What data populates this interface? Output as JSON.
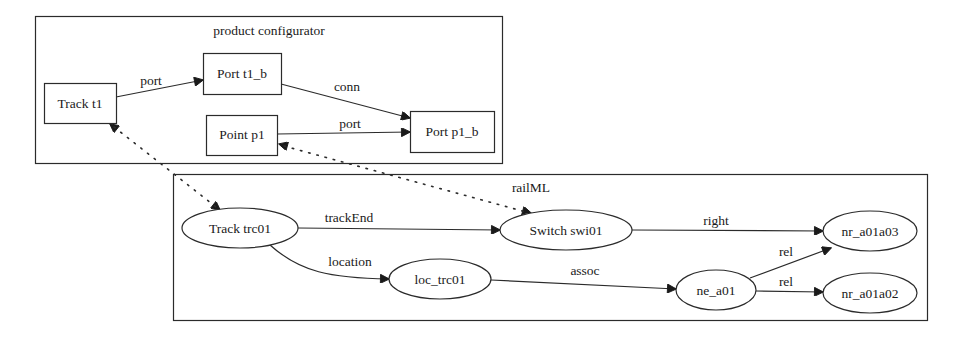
{
  "diagram": {
    "clusters": {
      "product_configurator": {
        "label": "product configurator"
      },
      "railml": {
        "label": "railML"
      }
    },
    "nodes": {
      "track_t1": {
        "label": "Track t1",
        "shape": "box"
      },
      "port_t1_b": {
        "label": "Port t1_b",
        "shape": "box"
      },
      "point_p1": {
        "label": "Point p1",
        "shape": "box"
      },
      "port_p1_b": {
        "label": "Port p1_b",
        "shape": "box"
      },
      "track_trc01": {
        "label": "Track trc01",
        "shape": "ellipse"
      },
      "switch_swi01": {
        "label": "Switch swi01",
        "shape": "ellipse"
      },
      "loc_trc01": {
        "label": "loc_trc01",
        "shape": "ellipse"
      },
      "ne_a01": {
        "label": "ne_a01",
        "shape": "ellipse"
      },
      "nr_a01a03": {
        "label": "nr_a01a03",
        "shape": "ellipse"
      },
      "nr_a01a02": {
        "label": "nr_a01a02",
        "shape": "ellipse"
      }
    },
    "edges": {
      "track_t1_port_t1_b": {
        "label": "port",
        "from": "Track t1",
        "to": "Port t1_b",
        "style": "solid"
      },
      "port_t1_b_port_p1_b": {
        "label": "conn",
        "from": "Port t1_b",
        "to": "Port p1_b",
        "style": "solid"
      },
      "point_p1_port_p1_b": {
        "label": "port",
        "from": "Point p1",
        "to": "Port p1_b",
        "style": "solid"
      },
      "track_trc01_switch_swi01": {
        "label": "trackEnd",
        "from": "Track trc01",
        "to": "Switch swi01",
        "style": "solid"
      },
      "track_trc01_loc_trc01": {
        "label": "location",
        "from": "Track trc01",
        "to": "loc_trc01",
        "style": "solid"
      },
      "switch_swi01_nr_a01a03": {
        "label": "right",
        "from": "Switch swi01",
        "to": "nr_a01a03",
        "style": "solid"
      },
      "loc_trc01_ne_a01": {
        "label": "assoc",
        "from": "loc_trc01",
        "to": "ne_a01",
        "style": "solid"
      },
      "ne_a01_nr_a01a03": {
        "label": "rel",
        "from": "ne_a01",
        "to": "nr_a01a03",
        "style": "solid"
      },
      "ne_a01_nr_a01a02": {
        "label": "rel",
        "from": "ne_a01",
        "to": "nr_a01a02",
        "style": "solid"
      },
      "track_t1_track_trc01": {
        "label": "",
        "from": "Track t1",
        "to": "Track trc01",
        "style": "dotted-bidirectional"
      },
      "point_p1_switch_swi01": {
        "label": "",
        "from": "Point p1",
        "to": "Switch swi01",
        "style": "dotted-bidirectional"
      }
    }
  }
}
